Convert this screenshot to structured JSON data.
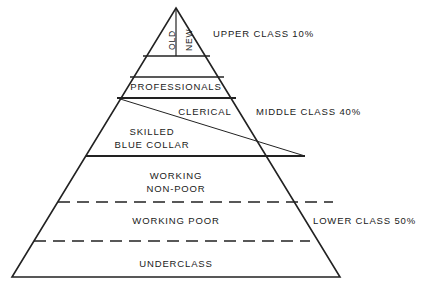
{
  "diagram": {
    "type": "social-class-pyramid",
    "apex_segments": [
      {
        "name": "old-money",
        "label": "OLD"
      },
      {
        "name": "new-money",
        "label": "NEW"
      }
    ],
    "bands": [
      {
        "name": "professionals",
        "label": "PROFESSIONALS"
      },
      {
        "name": "clerical",
        "label": "CLERICAL"
      },
      {
        "name": "skilled-blue-collar",
        "label_line1": "SKILLED",
        "label_line2": "BLUE COLLAR"
      },
      {
        "name": "working-non-poor",
        "label_line1": "WORKING",
        "label_line2": "NON-POOR"
      },
      {
        "name": "working-poor",
        "label": "WORKING POOR"
      },
      {
        "name": "underclass",
        "label": "UNDERCLASS"
      }
    ],
    "class_labels": [
      {
        "name": "upper-class",
        "label": "UPPER CLASS 10%"
      },
      {
        "name": "middle-class",
        "label": "MIDDLE CLASS 40%"
      },
      {
        "name": "lower-class",
        "label": "LOWER CLASS 50%"
      }
    ],
    "colors": {
      "stroke": "#222222",
      "text": "#1a1a1a",
      "background": "#ffffff"
    }
  }
}
